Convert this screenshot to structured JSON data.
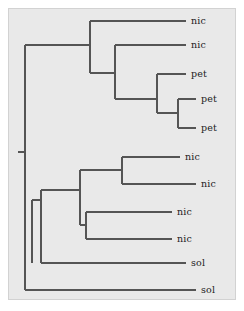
{
  "figure": {
    "kind": "phylogenetic-tree",
    "style": "rectangular-cladogram",
    "orientation": "left-to-right",
    "background_color": "#e9e9e9",
    "panel_border_color": "#d2d2d2",
    "line_color": "#555555",
    "label_color": "#1d1d1d",
    "tip_count": 10
  },
  "chart_data": {
    "type": "tree",
    "title": "",
    "xlabel": "",
    "ylabel": "",
    "leaf_labels": [
      "nic",
      "nic",
      "pet",
      "pet",
      "pet",
      "nic",
      "nic",
      "nic",
      "nic",
      "sol",
      "sol"
    ],
    "leaves": [
      {
        "id": "t1",
        "label": "nic",
        "x": 186,
        "y": 21
      },
      {
        "id": "t2",
        "label": "nic",
        "x": 186,
        "y": 45
      },
      {
        "id": "t3",
        "label": "pet",
        "x": 186,
        "y": 74
      },
      {
        "id": "t4",
        "label": "pet",
        "x": 196,
        "y": 99
      },
      {
        "id": "t5",
        "label": "pet",
        "x": 196,
        "y": 128
      },
      {
        "id": "t6",
        "label": "nic",
        "x": 180,
        "y": 157
      },
      {
        "id": "t7",
        "label": "nic",
        "x": 196,
        "y": 184
      },
      {
        "id": "t8",
        "label": "nic",
        "x": 172,
        "y": 212
      },
      {
        "id": "t9",
        "label": "nic",
        "x": 172,
        "y": 239
      },
      {
        "id": "t10",
        "label": "sol",
        "x": 186,
        "y": 263
      },
      {
        "id": "t11",
        "label": "sol",
        "x": 196,
        "y": 290
      }
    ],
    "label_offset_x": 5,
    "nodes": [
      {
        "id": "root",
        "x": 25,
        "y_top": 45,
        "y_bottom": 290
      },
      {
        "id": "upper",
        "x": 90,
        "y_top": 21,
        "y_bottom": 73
      },
      {
        "id": "upper2",
        "x": 115,
        "y_top": 45,
        "y_bottom": 99
      },
      {
        "id": "pet_clade",
        "x": 157,
        "y_top": 74,
        "y_bottom": 113
      },
      {
        "id": "pet_pair",
        "x": 178,
        "y_top": 99,
        "y_bottom": 128
      },
      {
        "id": "lower",
        "x": 32,
        "y_top": 200,
        "y_bottom": 263
      },
      {
        "id": "lower2",
        "x": 41,
        "y_top": 190,
        "y_bottom": 263
      },
      {
        "id": "nic_pair1",
        "x": 122,
        "y_top": 157,
        "y_bottom": 184
      },
      {
        "id": "nic_grp",
        "x": 80,
        "y_top": 170,
        "y_bottom": 225
      },
      {
        "id": "nic_pair2",
        "x": 86,
        "y_top": 212,
        "y_bottom": 239
      }
    ],
    "root_stub": {
      "x_start": 18,
      "x_end": 25,
      "y": 152
    }
  },
  "tips": [
    {
      "label": "nic",
      "x": 186,
      "y": 21
    },
    {
      "label": "nic",
      "x": 186,
      "y": 45
    },
    {
      "label": "pet",
      "x": 186,
      "y": 74
    },
    {
      "label": "pet",
      "x": 196,
      "y": 99
    },
    {
      "label": "pet",
      "x": 196,
      "y": 128
    },
    {
      "label": "nic",
      "x": 180,
      "y": 157
    },
    {
      "label": "nic",
      "x": 196,
      "y": 184
    },
    {
      "label": "nic",
      "x": 172,
      "y": 212
    },
    {
      "label": "nic",
      "x": 172,
      "y": 239
    },
    {
      "label": "sol",
      "x": 186,
      "y": 263
    },
    {
      "label": "sol",
      "x": 196,
      "y": 290
    }
  ]
}
